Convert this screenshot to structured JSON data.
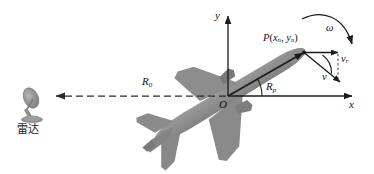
{
  "figure": {
    "type": "diagram",
    "background_color": "#ffffff",
    "width": 374,
    "height": 174
  },
  "colors": {
    "stroke": "#1a1a1a",
    "aircraft_fill": "#8a8a8a",
    "aircraft_fill_light": "#9a9a9a",
    "radar_fill": "#8c8c8c",
    "dashed": "#2b2b2b",
    "text": "#111111"
  },
  "axes": {
    "y_label": "y",
    "x_label": "x",
    "origin_label": "O"
  },
  "labels": {
    "point": {
      "name": "P",
      "open_paren": "(",
      "x_sym": "x",
      "x_sub": "n",
      "comma": ", ",
      "y_sym": "y",
      "y_sub": "n",
      "close_paren": ")",
      "full": "P(xn, yn)"
    },
    "range_to_radar": {
      "sym": "R",
      "sub": "0",
      "full": "R0"
    },
    "range_to_point": {
      "sym": "R",
      "sub": "p",
      "full": "Rp"
    },
    "angular_velocity": {
      "sym": "ω",
      "full": "ω"
    },
    "radial_velocity": {
      "sym": "v",
      "sub": "r",
      "full": "vr"
    },
    "velocity": {
      "sym": "v",
      "full": "v"
    }
  },
  "radar": {
    "label": "雷达",
    "name": "radar-station"
  },
  "aircraft": {
    "name": "aircraft-silhouette",
    "orientation_deg": 30
  },
  "annotations": {
    "dashed_line_name": "line-of-sight-R0",
    "solid_line_name": "vector-Rp",
    "rotation_arc_name": "rotation-arrow-omega",
    "angle_arc_origin_name": "angle-arc-at-origin",
    "angle_arc_velocity_name": "angle-arc-velocity"
  }
}
